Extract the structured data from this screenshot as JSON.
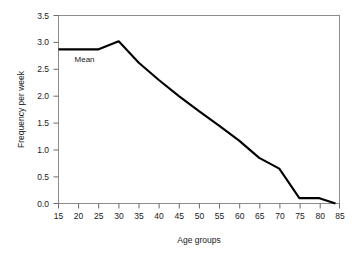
{
  "chart_data": {
    "type": "line",
    "title": "",
    "xlabel": "Age groups",
    "ylabel": "Frequency per week",
    "xlim": [
      15,
      85
    ],
    "ylim": [
      0.0,
      3.5
    ],
    "grid": false,
    "legend": null,
    "xticks": [
      15,
      20,
      25,
      30,
      35,
      40,
      45,
      50,
      55,
      60,
      65,
      70,
      75,
      80,
      85
    ],
    "xtick_labels": [
      "15",
      "20",
      "25",
      "30",
      "35",
      "40",
      "45",
      "50",
      "55",
      "60",
      "65",
      "70",
      "75",
      "80",
      "85"
    ],
    "yticks": [
      0.0,
      0.5,
      1.0,
      1.5,
      2.0,
      2.5,
      3.0,
      3.5
    ],
    "ytick_labels": [
      "0.0",
      "0.5",
      "1.0",
      "1.5",
      "2.0",
      "2.5",
      "3.0",
      "3.5"
    ],
    "series": [
      {
        "name": "Mean",
        "x": [
          15,
          25,
          30,
          35,
          40,
          45,
          50,
          55,
          60,
          65,
          70,
          75,
          80,
          84
        ],
        "values": [
          2.87,
          2.87,
          3.02,
          2.62,
          2.3,
          2.0,
          1.72,
          1.45,
          1.17,
          0.85,
          0.65,
          0.1,
          0.1,
          0.0
        ]
      }
    ],
    "annotations": [
      {
        "text": "Mean",
        "x": 19,
        "y": 2.63
      }
    ],
    "colors": {
      "line": "#000000",
      "frame": "#8c8c8c",
      "text": "#1a1a1a",
      "background": "#ffffff"
    }
  }
}
